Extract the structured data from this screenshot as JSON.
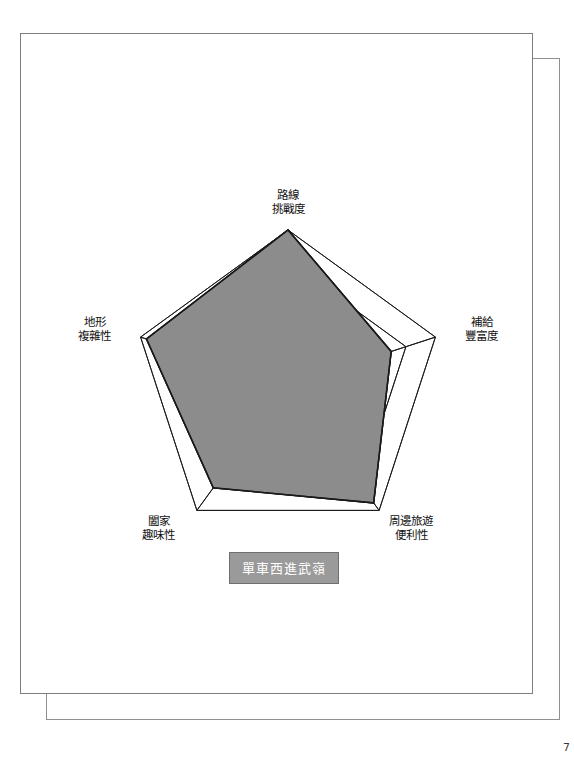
{
  "document": {
    "page_number": "7"
  },
  "chart_data": {
    "type": "radar",
    "title": "",
    "categories": [
      "路線挑戰度",
      "補給豐富度",
      "周邊旅遊便利性",
      "闔家趣味性",
      "地形複雜性"
    ],
    "category_lines": [
      [
        "路線",
        "挑戰度"
      ],
      [
        "補給",
        "豐富度"
      ],
      [
        "周邊旅遊",
        "便利性"
      ],
      [
        "闔家",
        "趣味性"
      ],
      [
        "地形",
        "複雜性"
      ]
    ],
    "series": [
      {
        "name": "單車西進武嶺",
        "values": [
          5.0,
          3.5,
          4.7,
          4.1,
          4.8
        ],
        "fill_color": "#8c8c8c",
        "line_color": "#1a1a1a"
      }
    ],
    "rlim": [
      0,
      5
    ],
    "rings": 5,
    "grid": true,
    "grid_color": "#1a1a1a",
    "legend_position": "bottom-center",
    "legend_label": "單車西進武嶺",
    "legend_bg": "#9a9a9a",
    "legend_text_color": "#ffffff"
  }
}
